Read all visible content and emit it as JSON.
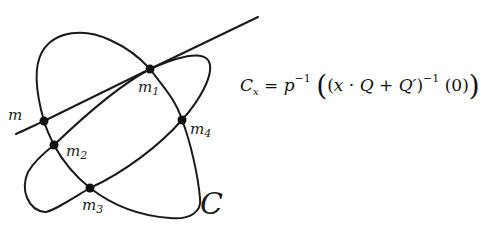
{
  "diagram": {
    "curve_label": "C",
    "points": [
      {
        "id": "m",
        "label": "m",
        "sub": "",
        "x": 44,
        "y": 121
      },
      {
        "id": "m1",
        "label": "m",
        "sub": "1",
        "x": 150,
        "y": 69
      },
      {
        "id": "m2",
        "label": "m",
        "sub": "2",
        "x": 54,
        "y": 145
      },
      {
        "id": "m3",
        "label": "m",
        "sub": "3",
        "x": 90,
        "y": 188
      },
      {
        "id": "m4",
        "label": "m",
        "sub": "4",
        "x": 182,
        "y": 120
      }
    ],
    "stroke_color": "#1a1a1a"
  },
  "formula": {
    "lhs": "C",
    "lhs_sub": "x",
    "eq": " = ",
    "p": "p",
    "p_exp": "−1",
    "open_big": "(",
    "open": "(",
    "x": "x",
    "dot": " · ",
    "Q": "Q",
    "plus": " + ",
    "Qprime": "Q′",
    "close": ")",
    "inner_exp": "−1",
    "arg": " (0)",
    "close_big": ")"
  },
  "caption": {
    "text": ""
  }
}
